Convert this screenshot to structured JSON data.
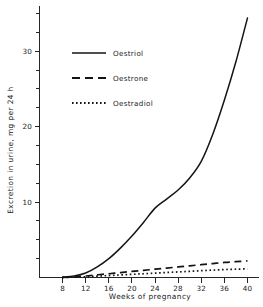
{
  "chart_data": {
    "type": "line",
    "title": "",
    "xlabel": "Weeks of pregnancy",
    "ylabel": "Excretion in urine, mg per 24 h",
    "xlim": [
      4,
      42
    ],
    "ylim": [
      0,
      36
    ],
    "xticks": [
      "8",
      "12",
      "16",
      "20",
      "24",
      "28",
      "32",
      "36",
      "40"
    ],
    "xtick_values": [
      8,
      12,
      16,
      20,
      24,
      28,
      32,
      36,
      40
    ],
    "yticks": [
      "10",
      "20",
      "30"
    ],
    "ytick_values": [
      10,
      20,
      30
    ],
    "yminor_values": [
      2.5,
      5,
      7.5,
      12.5,
      15,
      17.5,
      22.5,
      25,
      27.5,
      32.5,
      35
    ],
    "grid": false,
    "legend_position": "upper-left",
    "x": [
      8,
      10,
      12,
      14,
      16,
      18,
      20,
      22,
      24,
      26,
      28,
      30,
      32,
      34,
      36,
      38,
      40
    ],
    "series": [
      {
        "name": "Oestriol",
        "style": "solid",
        "color": "#141414",
        "values": [
          0.05,
          0.2,
          0.6,
          1.4,
          2.5,
          3.9,
          5.5,
          7.3,
          9.2,
          10.4,
          11.6,
          13.2,
          15.4,
          19.0,
          23.5,
          28.6,
          34.4
        ]
      },
      {
        "name": "Oestrone",
        "style": "dashed",
        "color": "#141414",
        "values": [
          0.02,
          0.08,
          0.2,
          0.35,
          0.5,
          0.65,
          0.8,
          0.95,
          1.1,
          1.25,
          1.4,
          1.55,
          1.7,
          1.85,
          2.0,
          2.1,
          2.2
        ]
      },
      {
        "name": "Oestradiol",
        "style": "dotted",
        "color": "#141414",
        "values": [
          0.01,
          0.04,
          0.1,
          0.18,
          0.26,
          0.34,
          0.42,
          0.5,
          0.58,
          0.66,
          0.74,
          0.82,
          0.9,
          0.98,
          1.05,
          1.1,
          1.15
        ]
      }
    ]
  },
  "legend": {
    "items": [
      {
        "label": "Oestriol",
        "style": "solid"
      },
      {
        "label": "Oestrone",
        "style": "dashed"
      },
      {
        "label": "Oestradiol",
        "style": "dotted"
      }
    ]
  },
  "axes": {
    "x_title": "Weeks of pregnancy",
    "y_title": "Excretion in urine, mg per 24 h"
  }
}
